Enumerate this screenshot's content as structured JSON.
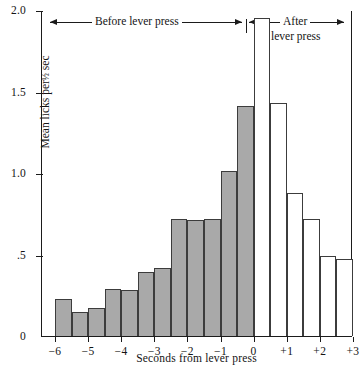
{
  "chart_data": {
    "type": "bar",
    "title": "",
    "xlabel": "Seconds from lever press",
    "ylabel": "Mean licks per ½ sec",
    "ylim": [
      0,
      2.0
    ],
    "xlim": [
      -6.0,
      3.0
    ],
    "grid": false,
    "bin_width_seconds": 0.5,
    "categories": [
      "-6.0",
      "-5.5",
      "-5.0",
      "-4.5",
      "-4.0",
      "-3.5",
      "-3.0",
      "-2.5",
      "-2.0",
      "-1.5",
      "-1.0",
      "-0.5",
      "0.0",
      "0.5",
      "1.0",
      "1.5",
      "2.0",
      "2.5"
    ],
    "values": [
      0.23,
      0.15,
      0.17,
      0.29,
      0.28,
      0.39,
      0.42,
      0.72,
      0.71,
      0.72,
      1.01,
      1.41,
      1.95,
      1.43,
      0.88,
      0.72,
      0.49,
      0.47
    ],
    "bar_styles": [
      "filled",
      "filled",
      "filled",
      "filled",
      "filled",
      "filled",
      "filled",
      "filled",
      "filled",
      "filled",
      "filled",
      "filled",
      "open",
      "open",
      "open",
      "open",
      "open",
      "open"
    ],
    "series": [
      {
        "name": "Before lever press",
        "style": "filled-gray",
        "x": [
          -6.0,
          -5.5,
          -5.0,
          -4.5,
          -4.0,
          -3.5,
          -3.0,
          -2.5,
          -2.0,
          -1.5,
          -1.0,
          -0.5
        ],
        "values": [
          0.23,
          0.15,
          0.17,
          0.29,
          0.28,
          0.39,
          0.42,
          0.72,
          0.71,
          0.72,
          1.01,
          1.41
        ]
      },
      {
        "name": "After lever press",
        "style": "open-white",
        "x": [
          0.0,
          0.5,
          1.0,
          1.5,
          2.0,
          2.5
        ],
        "values": [
          1.95,
          1.43,
          0.88,
          0.72,
          0.49,
          0.47
        ]
      }
    ],
    "yticks": [
      0,
      0.5,
      1.0,
      1.5,
      2.0
    ],
    "ytick_labels": [
      "0",
      ".5",
      "1.0",
      "1.5",
      "2.0"
    ],
    "xticks": [
      -6,
      -5,
      -4,
      -3,
      -2,
      -1,
      0,
      1,
      2,
      3
    ],
    "xtick_labels": [
      "−6",
      "−5",
      "−4",
      "−3",
      "−2",
      "−1",
      "0",
      "+1",
      "+2",
      "+3"
    ],
    "annotations": [
      {
        "name": "before-span",
        "text": "Before lever press"
      },
      {
        "name": "after-span",
        "text_line1": "After",
        "text_line2": "lever press"
      }
    ],
    "colors": {
      "bar_fill": "#a9a9a9",
      "bar_edge": "#3c3c3c",
      "axis": "#1b1b1b",
      "background": "#ffffff",
      "open_bar_fill": "#ffffff"
    }
  },
  "axes": {
    "y_title": "Mean licks per",
    "y_title_fraction": "½",
    "y_title_unit": "sec",
    "x_title": "Seconds from lever press"
  },
  "annotations": {
    "before": "Before lever press",
    "after_line1": "After",
    "after_line2": "lever press"
  }
}
